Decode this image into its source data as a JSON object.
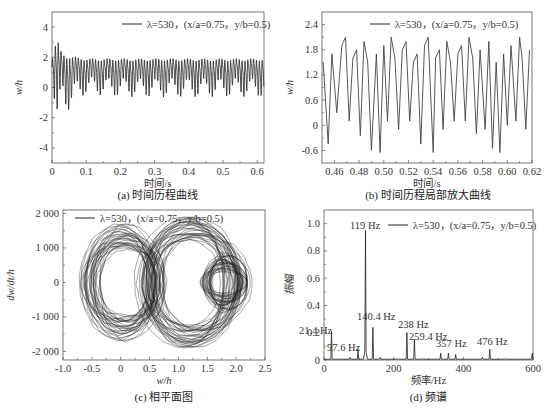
{
  "chart_data": [
    {
      "id": "a",
      "type": "line",
      "title": "(a) 时间历程曲线",
      "xlabel": "时间/s",
      "ylabel": "w/h",
      "xlim": [
        0,
        0.62
      ],
      "ylim": [
        -5,
        5
      ],
      "xticks": [
        0,
        0.1,
        0.2,
        0.3,
        0.4,
        0.5,
        0.6
      ],
      "xtick_labels": [
        "0",
        "0.1",
        "0.2",
        "0.3",
        "0.4",
        "0.5",
        "0.6"
      ],
      "yticks": [
        -4,
        -2,
        0,
        2,
        4
      ],
      "ytick_labels": [
        "-4",
        "-2",
        "0",
        "2",
        "4"
      ],
      "legend": [
        "λ=530，(x/a=0.75，y/b=0.5)"
      ],
      "legend_position": "upper right",
      "series": [
        {
          "name": "λ=530，(x/a=0.75，y/b=0.5)",
          "description": "transient with peaks ~3.6 and troughs ~-4.7 before 0.03 s, settling to steady oscillation between about -0.7 and 2.1",
          "x": [
            0,
            0.01,
            0.015,
            0.02,
            0.025,
            0.03,
            0.04,
            0.05,
            0.06,
            0.08,
            0.1,
            0.2,
            0.3,
            0.4,
            0.5,
            0.6
          ],
          "envelope_max": [
            2.0,
            3.3,
            3.6,
            3.5,
            2.8,
            2.5,
            2.4,
            2.4,
            2.3,
            2.2,
            2.1,
            2.1,
            2.1,
            2.1,
            2.1,
            2.1
          ],
          "envelope_min": [
            0.5,
            -2.0,
            -4.0,
            -4.7,
            -2.0,
            -1.0,
            -1.5,
            -1.6,
            -1.4,
            -0.8,
            -0.5,
            -0.7,
            -0.7,
            -0.7,
            -0.7,
            -0.7
          ]
        }
      ]
    },
    {
      "id": "b",
      "type": "line",
      "title": "(b) 时间历程局部放大曲线",
      "xlabel": "时间/s",
      "ylabel": "w/h",
      "xlim": [
        0.45,
        0.62
      ],
      "ylim": [
        -0.9,
        2.7
      ],
      "xticks": [
        0.46,
        0.48,
        0.5,
        0.52,
        0.54,
        0.56,
        0.58,
        0.6,
        0.62
      ],
      "xtick_labels": [
        "0.46",
        "0.48",
        "0.50",
        "0.52",
        "0.54",
        "0.56",
        "0.58",
        "0.60",
        "0.62"
      ],
      "yticks": [
        -0.6,
        0,
        0.6,
        1.2,
        1.8,
        2.4
      ],
      "ytick_labels": [
        "-0.6",
        "0",
        "0.6",
        "1.2",
        "1.8",
        "2.4"
      ],
      "legend": [
        "λ=530，(x/a=0.75，y/b=0.5)"
      ],
      "legend_position": "upper center",
      "series": [
        {
          "name": "λ=530，(x/a=0.75，y/b=0.5)",
          "peaks_x": [
            0.451,
            0.458,
            0.466,
            0.469,
            0.475,
            0.478,
            0.484,
            0.487,
            0.494,
            0.5,
            0.506,
            0.509,
            0.515,
            0.518,
            0.524,
            0.527,
            0.533,
            0.536,
            0.542,
            0.545,
            0.551,
            0.554,
            0.56,
            0.563,
            0.569,
            0.572,
            0.578,
            0.585,
            0.591,
            0.597,
            0.603,
            0.61,
            0.612,
            0.618
          ],
          "troughs_x": [
            0.455,
            0.462,
            0.472,
            0.481,
            0.49,
            0.497,
            0.503,
            0.512,
            0.521,
            0.53,
            0.54,
            0.548,
            0.557,
            0.566,
            0.575,
            0.582,
            0.588,
            0.594,
            0.6,
            0.607,
            0.615
          ],
          "troughs_y": [
            -0.45,
            0.3,
            0.1,
            -0.25,
            -0.6,
            -0.65,
            0.1,
            -0.1,
            0.1,
            -0.45,
            -0.65,
            -0.1,
            0.1,
            0.1,
            -0.2,
            -0.1,
            -0.55,
            -0.65,
            0.0,
            0.1,
            -0.1
          ],
          "peak_range": [
            1.5,
            2.15
          ]
        }
      ]
    },
    {
      "id": "c",
      "type": "line",
      "title": "(c) 相平面图",
      "xlabel": "w/h",
      "ylabel": "dw/dt/h",
      "xlim": [
        -1.0,
        2.5
      ],
      "ylim": [
        -2250,
        2100
      ],
      "xticks": [
        -1.0,
        -0.5,
        0,
        0.5,
        1.0,
        1.5,
        2.0,
        2.5
      ],
      "xtick_labels": [
        "-1.0",
        "-0.5",
        "0",
        "0.5",
        "1.0",
        "1.5",
        "2.0",
        "2.5"
      ],
      "yticks": [
        -2000,
        -1000,
        0,
        1000,
        2000
      ],
      "ytick_labels": [
        "-2 000",
        "-1 000",
        "0",
        "1 000",
        "2 000"
      ],
      "legend": [
        "λ=530，(x/a=0.75，y/b=0.5)"
      ],
      "legend_position": "upper left",
      "series": [
        {
          "name": "λ=530，(x/a=0.75，y/b=0.5)",
          "description": "chaotic phase trajectory: two overlapping lobes centred near w/h≈0.1 and w/h≈1.2, spanning w/h -0.7…2.2 and dw/dt/h -1900…1900"
        }
      ]
    },
    {
      "id": "d",
      "type": "bar",
      "title": "(d) 频谱",
      "xlabel": "频率/Hz",
      "ylabel": "振幅",
      "xlim": [
        0,
        600
      ],
      "ylim": [
        0,
        1.1
      ],
      "xticks": [
        0,
        200,
        400,
        600
      ],
      "xtick_labels": [
        "0",
        "200",
        "400",
        "600"
      ],
      "yticks": [
        0,
        0.2,
        0.4,
        0.6,
        0.8,
        1.0
      ],
      "ytick_labels": [
        "0",
        "0.2",
        "0.4",
        "0.6",
        "0.8",
        "1.0"
      ],
      "legend": [
        "λ=530，(x/a=0.75，y/b=0.5)"
      ],
      "legend_position": "upper right",
      "categories": [
        "21.4 Hz",
        "97.6 Hz",
        "119 Hz",
        "140.4 Hz",
        "238 Hz",
        "259.4 Hz",
        "357 Hz",
        "476 Hz"
      ],
      "x": [
        21.4,
        97.6,
        119,
        140.4,
        238,
        259.4,
        357,
        476
      ],
      "values": [
        0.21,
        0.08,
        0.95,
        0.24,
        0.2,
        0.15,
        0.05,
        0.08
      ],
      "minor_peaks": {
        "x": [
          40,
          75,
          162,
          215,
          280,
          335,
          378,
          455,
          520,
          598
        ],
        "values": [
          0.01,
          0.02,
          0.02,
          0.01,
          0.01,
          0.05,
          0.04,
          0.02,
          0.01,
          0.05
        ]
      },
      "annotations": [
        "119 Hz",
        "21.4 Hz",
        "97.6 Hz",
        "140.4 Hz",
        "238 Hz",
        "259.4 Hz",
        "357 Hz",
        "476 Hz"
      ]
    }
  ],
  "captions": {
    "a": "(a) 时间历程曲线",
    "b": "(b) 时间历程局部放大曲线",
    "c": "(c) 相平面图",
    "d": "(d) 频谱"
  },
  "legend_label": "λ=530，(x/a=0.75，y/b=0.5)",
  "colors": {
    "line": "#222222",
    "axis": "#555555",
    "bg": "#ffffff"
  }
}
